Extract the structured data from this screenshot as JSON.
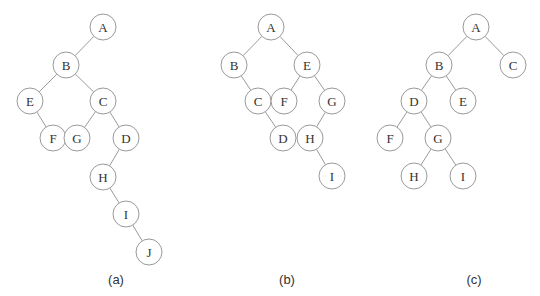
{
  "node_radius": 13,
  "trees": [
    {
      "caption": "(a)",
      "caption_pos": [
        116,
        279
      ],
      "nodes": [
        {
          "id": "A",
          "x": 103,
          "y": 27
        },
        {
          "id": "B",
          "x": 66,
          "y": 65
        },
        {
          "id": "E",
          "x": 30,
          "y": 101
        },
        {
          "id": "C",
          "x": 103,
          "y": 101
        },
        {
          "id": "F",
          "x": 53,
          "y": 138
        },
        {
          "id": "G",
          "x": 77,
          "y": 138
        },
        {
          "id": "D",
          "x": 126,
          "y": 138
        },
        {
          "id": "H",
          "x": 103,
          "y": 177
        },
        {
          "id": "I",
          "x": 126,
          "y": 214
        },
        {
          "id": "J",
          "x": 149,
          "y": 252
        }
      ],
      "edges": [
        [
          "A",
          "B"
        ],
        [
          "B",
          "E"
        ],
        [
          "B",
          "C"
        ],
        [
          "E",
          "F"
        ],
        [
          "C",
          "G"
        ],
        [
          "C",
          "D"
        ],
        [
          "D",
          "H"
        ],
        [
          "H",
          "I"
        ],
        [
          "I",
          "J"
        ]
      ]
    },
    {
      "caption": "(b)",
      "caption_pos": [
        287,
        279
      ],
      "nodes": [
        {
          "id": "A",
          "x": 271,
          "y": 27
        },
        {
          "id": "B",
          "x": 234,
          "y": 65
        },
        {
          "id": "E",
          "x": 307,
          "y": 65
        },
        {
          "id": "C",
          "x": 258,
          "y": 101
        },
        {
          "id": "F",
          "x": 284,
          "y": 101
        },
        {
          "id": "G",
          "x": 332,
          "y": 101
        },
        {
          "id": "D",
          "x": 283,
          "y": 138
        },
        {
          "id": "H",
          "x": 310,
          "y": 138
        },
        {
          "id": "I",
          "x": 332,
          "y": 176
        }
      ],
      "edges": [
        [
          "A",
          "B"
        ],
        [
          "A",
          "E"
        ],
        [
          "B",
          "C"
        ],
        [
          "C",
          "D"
        ],
        [
          "E",
          "F"
        ],
        [
          "E",
          "G"
        ],
        [
          "G",
          "H"
        ],
        [
          "H",
          "I"
        ]
      ]
    },
    {
      "caption": "(c)",
      "caption_pos": [
        474,
        279
      ],
      "nodes": [
        {
          "id": "A",
          "x": 476,
          "y": 27
        },
        {
          "id": "B",
          "x": 439,
          "y": 65
        },
        {
          "id": "C",
          "x": 513,
          "y": 65
        },
        {
          "id": "D",
          "x": 414,
          "y": 101
        },
        {
          "id": "E",
          "x": 463,
          "y": 101
        },
        {
          "id": "F",
          "x": 390,
          "y": 138
        },
        {
          "id": "G",
          "x": 438,
          "y": 138
        },
        {
          "id": "H",
          "x": 414,
          "y": 176
        },
        {
          "id": "I",
          "x": 463,
          "y": 176
        }
      ],
      "edges": [
        [
          "A",
          "B"
        ],
        [
          "A",
          "C"
        ],
        [
          "B",
          "D"
        ],
        [
          "B",
          "E"
        ],
        [
          "D",
          "F"
        ],
        [
          "D",
          "G"
        ],
        [
          "G",
          "H"
        ],
        [
          "G",
          "I"
        ]
      ]
    }
  ]
}
